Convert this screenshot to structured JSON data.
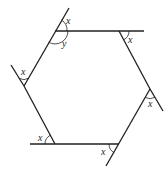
{
  "diagram": {
    "type": "hexagon-exterior-angles",
    "colors": {
      "stroke": "#231f20",
      "background": "#ffffff"
    },
    "labels": {
      "exterior_top_left": "x",
      "interior_top_left": "y",
      "exterior_top_right": "x",
      "exterior_left": "x",
      "exterior_right": "x",
      "exterior_bottom_left": "x",
      "exterior_bottom_right": "x"
    }
  }
}
